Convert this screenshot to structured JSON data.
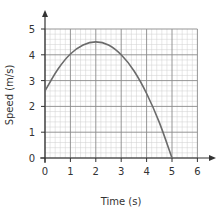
{
  "chart_data": {
    "type": "line",
    "title": "",
    "xlabel": "Time (s)",
    "ylabel": "Speed (m/s)",
    "xlim": [
      0,
      6
    ],
    "ylim": [
      0,
      5
    ],
    "x_ticks": [
      "0",
      "1",
      "2",
      "3",
      "4",
      "5",
      "6"
    ],
    "y_ticks": [
      "0",
      "1",
      "2",
      "3",
      "4",
      "5"
    ],
    "grid": true,
    "minor_grid_per_unit": 5,
    "legend": null,
    "series": [
      {
        "name": "speed",
        "x": [
          0,
          0.5,
          1,
          1.5,
          2,
          2.5,
          3,
          3.5,
          4,
          4.5,
          5
        ],
        "values": [
          2.6,
          3.43,
          4.03,
          4.38,
          4.5,
          4.38,
          4.0,
          3.38,
          2.5,
          1.38,
          0.0
        ]
      }
    ],
    "key_points": [
      {
        "label": "start",
        "x": 0,
        "y": 2.6
      },
      {
        "label": "maximum",
        "x": 2,
        "y": 4.5
      },
      {
        "label": "end",
        "x": 5,
        "y": 0
      }
    ]
  },
  "colors": {
    "axis": "#333333",
    "major_grid": "#8a8a8a",
    "minor_grid": "#cfcfcf",
    "curve": "#6b6b6b"
  }
}
